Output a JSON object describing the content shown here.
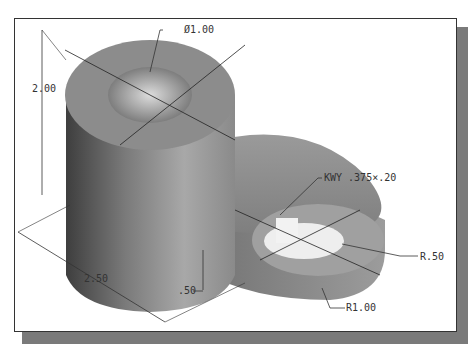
{
  "caption_fragment": "",
  "dimensions": {
    "hole_diameter": "Ø1.00",
    "height": "2.00",
    "keyway": "KWY .375×.20",
    "small_radius": "R.50",
    "large_radius": "R1.00",
    "length": "2.50",
    "thickness": ".50"
  },
  "colors": {
    "frame_shadow": "#7a7a7a",
    "part_dark": "#555555",
    "part_mid": "#8c8c8c",
    "part_light": "#bdbdbd"
  }
}
